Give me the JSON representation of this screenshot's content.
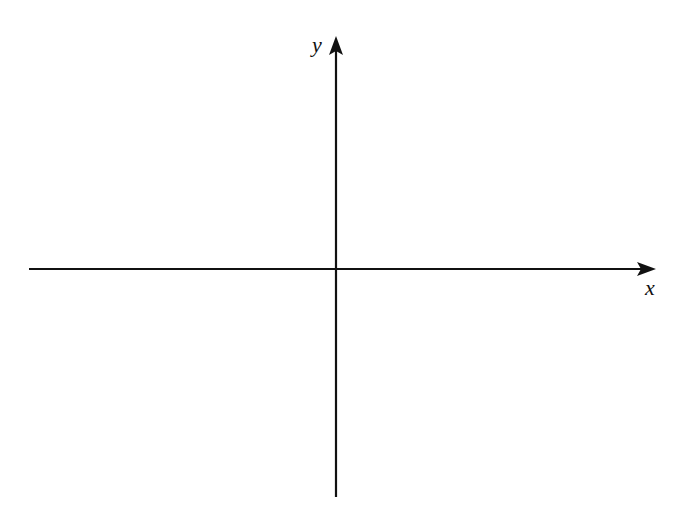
{
  "diagram": {
    "type": "cartesian-axes",
    "x_axis": {
      "label": "x",
      "from": [
        29,
        269
      ],
      "to": [
        656,
        269
      ],
      "arrow": "positive"
    },
    "y_axis": {
      "label": "y",
      "from": [
        336,
        497
      ],
      "to": [
        336,
        36
      ],
      "arrow": "positive"
    },
    "origin": [
      336,
      269
    ],
    "stroke_color": "#111111",
    "background": "#ffffff"
  }
}
